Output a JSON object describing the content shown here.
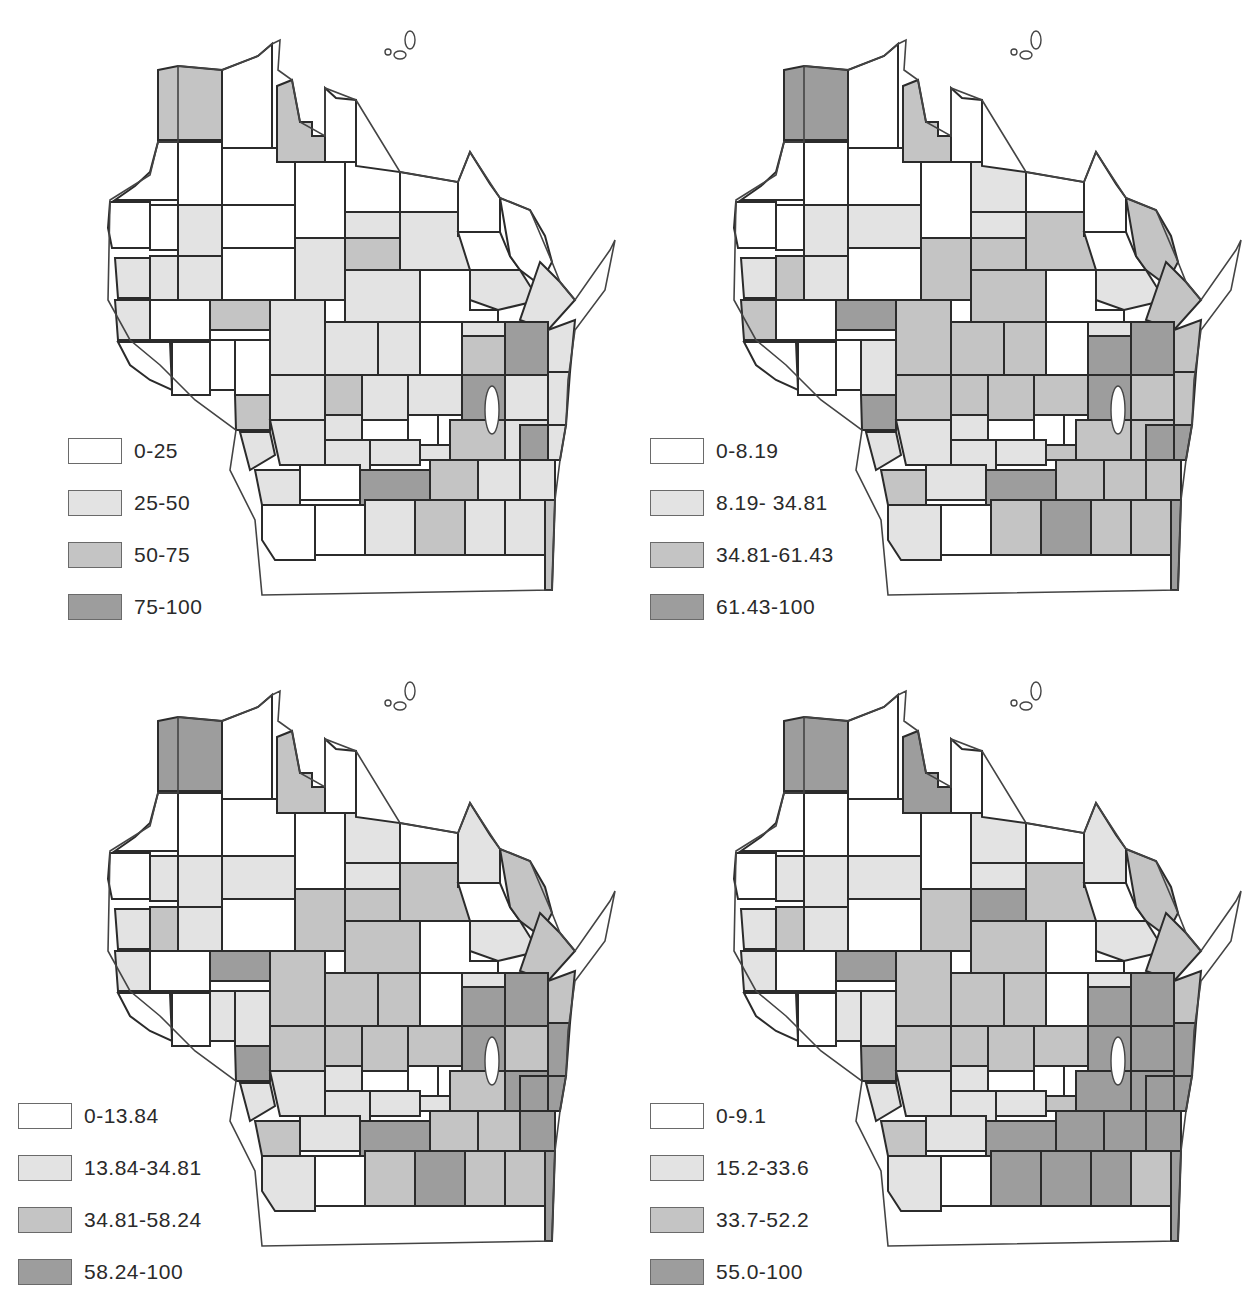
{
  "colors": {
    "class0": "#ffffff",
    "class1": "#e3e3e3",
    "class2": "#c4c4c4",
    "class3": "#9d9d9d",
    "border": "#2b2b2b"
  },
  "maps": [
    {
      "id": "top-left",
      "legend": [
        {
          "label": "0-25",
          "class": 0
        },
        {
          "label": "25-50",
          "class": 1
        },
        {
          "label": "50-75",
          "class": 2
        },
        {
          "label": "75-100",
          "class": 3
        }
      ],
      "fills": [
        2,
        0,
        2,
        0,
        0,
        0,
        0,
        0,
        0,
        0,
        0,
        0,
        0,
        1,
        0,
        1,
        2,
        1,
        0,
        0,
        1,
        1,
        1,
        0,
        1,
        1,
        0,
        1,
        1,
        1,
        2,
        0,
        1,
        1,
        1,
        0,
        1,
        0,
        0,
        0,
        0,
        2,
        1,
        1,
        2,
        3,
        1,
        2,
        1,
        1,
        0,
        0,
        0,
        3,
        1,
        1,
        1,
        1,
        1,
        1,
        1,
        2,
        1,
        1,
        0,
        3,
        2,
        1,
        1,
        1,
        3,
        0,
        0,
        1,
        2,
        1,
        1,
        2
      ]
    },
    {
      "id": "top-right",
      "legend": [
        {
          "label": "0-8.19",
          "class": 0
        },
        {
          "label": "8.19- 34.81",
          "class": 1
        },
        {
          "label": "34.81-61.43",
          "class": 2
        },
        {
          "label": "61.43-100",
          "class": 3
        }
      ],
      "fills": [
        3,
        0,
        2,
        0,
        0,
        0,
        0,
        0,
        1,
        0,
        0,
        0,
        0,
        1,
        1,
        1,
        2,
        2,
        0,
        2,
        1,
        2,
        1,
        0,
        2,
        2,
        0,
        1,
        2,
        2,
        3,
        0,
        2,
        2,
        2,
        0,
        1,
        0,
        0,
        0,
        1,
        2,
        2,
        2,
        3,
        3,
        2,
        3,
        2,
        1,
        0,
        0,
        0,
        3,
        2,
        2,
        1,
        1,
        1,
        1,
        2,
        2,
        2,
        2,
        1,
        3,
        2,
        2,
        2,
        3,
        3,
        1,
        0,
        2,
        3,
        2,
        2,
        3
      ]
    },
    {
      "id": "bottom-left",
      "legend": [
        {
          "label": "0-13.84",
          "class": 0
        },
        {
          "label": "13.84-34.81",
          "class": 1
        },
        {
          "label": "34.81-58.24",
          "class": 2
        },
        {
          "label": "58.24-100",
          "class": 3
        }
      ],
      "fills": [
        3,
        0,
        2,
        0,
        0,
        0,
        0,
        0,
        1,
        0,
        1,
        0,
        1,
        1,
        1,
        1,
        2,
        2,
        0,
        2,
        1,
        2,
        1,
        0,
        2,
        2,
        0,
        1,
        2,
        1,
        3,
        0,
        2,
        2,
        2,
        0,
        1,
        0,
        0,
        1,
        1,
        2,
        2,
        2,
        3,
        3,
        2,
        3,
        2,
        1,
        0,
        0,
        0,
        3,
        2,
        3,
        1,
        1,
        1,
        1,
        1,
        2,
        3,
        2,
        1,
        3,
        2,
        2,
        3,
        3,
        3,
        1,
        0,
        2,
        3,
        2,
        2,
        3
      ]
    },
    {
      "id": "bottom-right",
      "legend": [
        {
          "label": "0-9.1",
          "class": 0
        },
        {
          "label": "15.2-33.6",
          "class": 1
        },
        {
          "label": "33.7-52.2",
          "class": 2
        },
        {
          "label": "55.0-100",
          "class": 3
        }
      ],
      "fills": [
        3,
        0,
        3,
        0,
        0,
        0,
        0,
        0,
        1,
        0,
        1,
        0,
        1,
        1,
        1,
        1,
        3,
        2,
        0,
        2,
        1,
        2,
        1,
        0,
        2,
        2,
        0,
        1,
        2,
        1,
        3,
        0,
        2,
        2,
        2,
        0,
        1,
        0,
        0,
        1,
        1,
        2,
        2,
        2,
        3,
        3,
        2,
        3,
        2,
        1,
        0,
        0,
        0,
        3,
        3,
        3,
        1,
        1,
        1,
        1,
        2,
        3,
        3,
        2,
        1,
        3,
        3,
        3,
        3,
        3,
        3,
        1,
        0,
        3,
        3,
        3,
        2,
        3
      ]
    }
  ]
}
